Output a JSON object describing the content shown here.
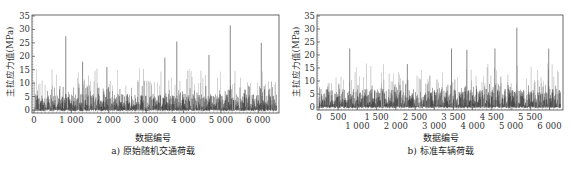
{
  "chart_data": [
    {
      "type": "line",
      "title": "a) 原始随机交通荷载",
      "xlabel": "数据编号",
      "ylabel": "主拉应力值(MPa)",
      "xlim": [
        0,
        6500
      ],
      "ylim": [
        0,
        35
      ],
      "grid": false,
      "legend": null,
      "x_ticks": [
        0,
        1000,
        2000,
        3000,
        4000,
        5000,
        6000
      ],
      "x_tick_labels": [
        "0",
        "1 000",
        "2 000",
        "3 000",
        "4 000",
        "5 000",
        "6 000"
      ],
      "y_ticks": [
        0,
        5,
        10,
        15,
        20,
        25,
        30,
        35
      ],
      "notable_peaks": [
        {
          "x": 850,
          "y": 27.5
        },
        {
          "x": 1300,
          "y": 18
        },
        {
          "x": 1950,
          "y": 16
        },
        {
          "x": 3500,
          "y": 19.5
        },
        {
          "x": 3820,
          "y": 25.5
        },
        {
          "x": 4680,
          "y": 20.5
        },
        {
          "x": 5250,
          "y": 31.5
        },
        {
          "x": 6080,
          "y": 25
        }
      ],
      "typical_range": [
        0,
        15
      ],
      "baseline_dense_band": [
        0,
        6
      ],
      "num_points": 6500
    },
    {
      "type": "line",
      "title": "b) 标准车辆荷载",
      "xlabel": "数据编号",
      "ylabel": "主拉应力值(MPa)",
      "xlim": [
        0,
        6300
      ],
      "ylim": [
        0,
        35
      ],
      "grid": false,
      "legend": null,
      "x_ticks": [
        0,
        500,
        1000,
        1500,
        2000,
        2500,
        3000,
        3500,
        4000,
        4500,
        5000,
        5500,
        6000
      ],
      "x_tick_labels": [
        "0",
        "500",
        "1 000",
        "1 500",
        "2 000",
        "2 500",
        "3 000",
        "3 500",
        "4 000",
        "4 500",
        "5 000",
        "5 500",
        "6 000"
      ],
      "y_ticks": [
        0,
        5,
        10,
        15,
        20,
        25,
        30,
        35
      ],
      "notable_peaks": [
        {
          "x": 800,
          "y": 22.5
        },
        {
          "x": 2300,
          "y": 16.5
        },
        {
          "x": 3450,
          "y": 22.5
        },
        {
          "x": 3850,
          "y": 22
        },
        {
          "x": 4580,
          "y": 22.5
        },
        {
          "x": 5150,
          "y": 30.5
        },
        {
          "x": 5980,
          "y": 22.5
        }
      ],
      "typical_range": [
        0,
        16
      ],
      "baseline_dense_band": [
        0,
        7
      ],
      "num_points": 6300
    }
  ]
}
